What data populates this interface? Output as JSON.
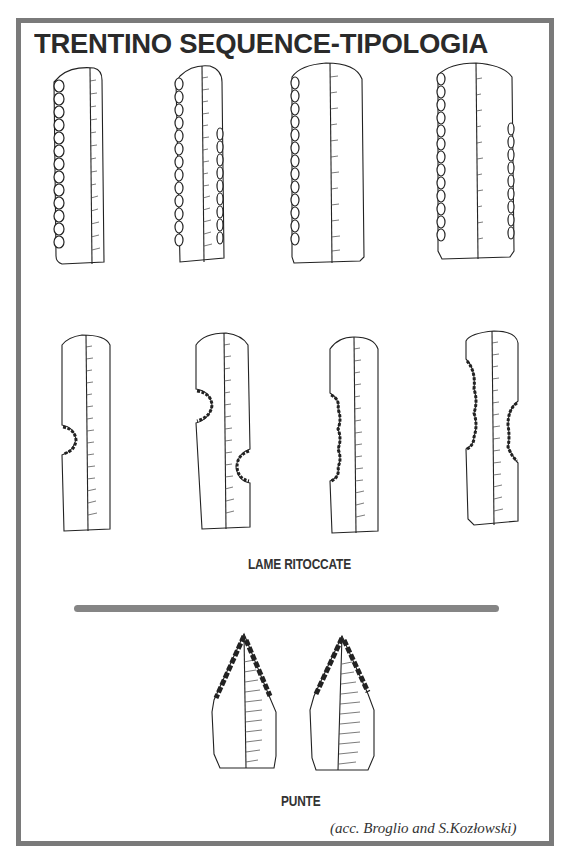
{
  "title": "TRENTINO SEQUENCE-TIPOLOGIA",
  "sections": [
    {
      "label": "LAME RITOCCATE",
      "tools": [
        {
          "id": "blade-1",
          "type": "retouched-blade",
          "retouch": "left-edge-continuous"
        },
        {
          "id": "blade-2",
          "type": "retouched-blade",
          "retouch": "both-edges-continuous"
        },
        {
          "id": "blade-3",
          "type": "retouched-blade",
          "retouch": "left-edge-continuous"
        },
        {
          "id": "blade-4",
          "type": "retouched-blade",
          "retouch": "both-edges-partial"
        },
        {
          "id": "blade-5",
          "type": "notched-blade",
          "retouch": "single-left-notch"
        },
        {
          "id": "blade-6",
          "type": "notched-blade",
          "retouch": "alternate-notches"
        },
        {
          "id": "blade-7",
          "type": "denticulate-blade",
          "retouch": "left-denticulate"
        },
        {
          "id": "blade-8",
          "type": "denticulate-blade",
          "retouch": "bilateral-denticulate"
        }
      ]
    },
    {
      "label": "PUNTE",
      "tools": [
        {
          "id": "point-1",
          "type": "point",
          "retouch": "bilateral-tip"
        },
        {
          "id": "point-2",
          "type": "point",
          "retouch": "bilateral-tip"
        }
      ]
    }
  ],
  "credit": "(acc. Broglio and S.Kozłowski)",
  "colors": {
    "frame": "#7a7a7a",
    "divider": "#858585",
    "ink": "#222222"
  }
}
